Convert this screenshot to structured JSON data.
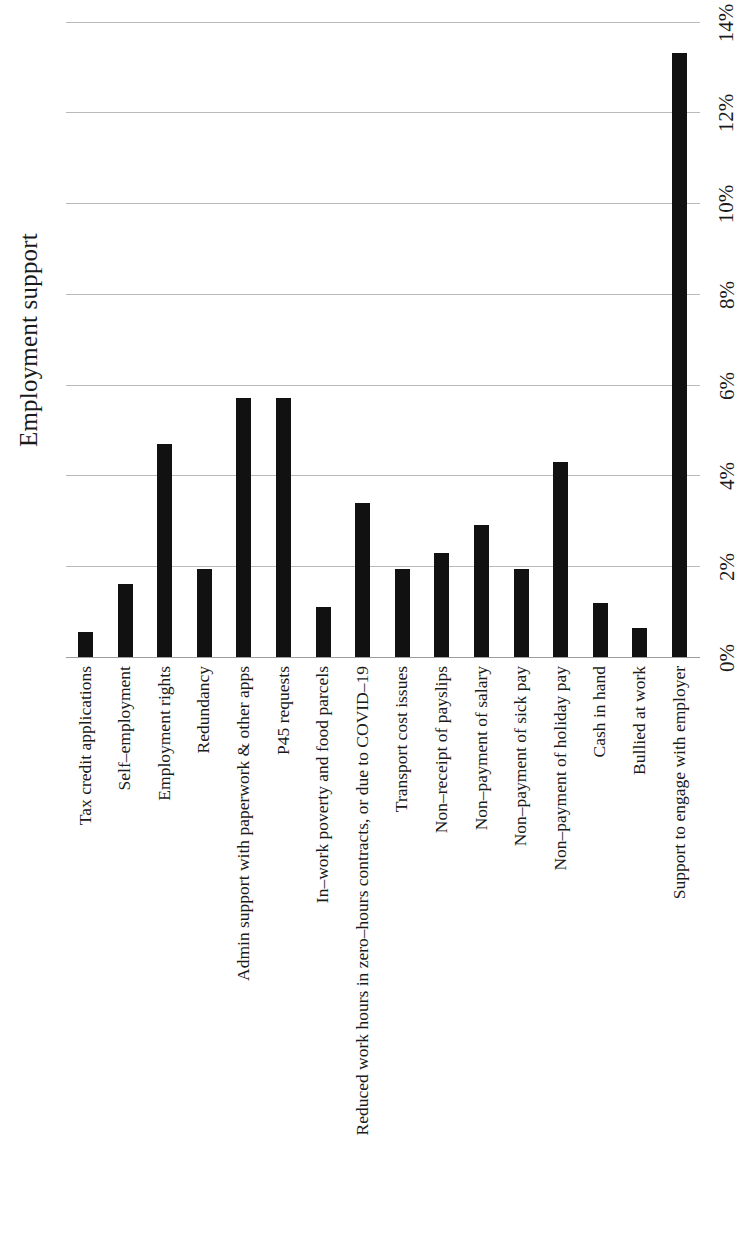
{
  "axis_title": "Employment support",
  "chart_data": {
    "type": "bar",
    "title": "",
    "subtitle": "",
    "xlabel": "",
    "ylabel": "Employment support",
    "orientation": "vertical-bars-rotated-page",
    "grid": true,
    "legend": null,
    "legend_position": "none",
    "bar_color": "#111111",
    "grid_color": "#b9b9b9",
    "ylim": [
      0,
      14.1
    ],
    "ytick_labels": [
      "0%",
      "2%",
      "4%",
      "6%",
      "8%",
      "10%",
      "12%",
      "14%"
    ],
    "ytick_values": [
      0,
      2,
      4,
      6,
      8,
      10,
      12,
      14
    ],
    "value_unit": "%",
    "categories": [
      "Tax credit applications",
      "Self–employment",
      "Employment rights",
      "Redundancy",
      "Admin support with paperwork & other apps",
      "P45 requests",
      "In–work poverty and food parcels",
      "Reduced work hours in zero–hours contracts, or due to COVID–19",
      "Transport cost issues",
      "Non–receipt of payslips",
      "Non–payment of salary",
      "Non–payment of sick pay",
      "Non–payment of holiday pay",
      "Cash in hand",
      "Bullied at work",
      "Support to engage with employer"
    ],
    "values": [
      0.55,
      1.6,
      4.7,
      1.95,
      5.7,
      5.7,
      1.1,
      3.4,
      1.95,
      2.3,
      2.9,
      1.95,
      4.3,
      1.2,
      0.65,
      13.3
    ]
  }
}
